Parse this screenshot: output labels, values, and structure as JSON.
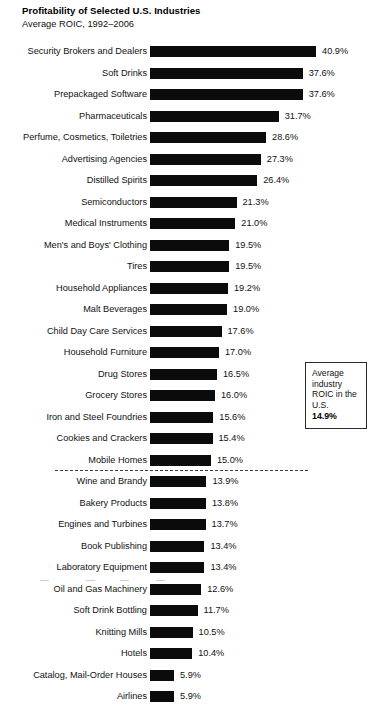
{
  "header": {
    "title": "Profitability of Selected U.S. Industries",
    "subtitle": "Average ROIC, 1992–2006"
  },
  "callout": {
    "line1": "Average industry",
    "line2": "ROIC in the U.S.",
    "value": "14.9%"
  },
  "chart_data": {
    "type": "bar",
    "orientation": "horizontal",
    "title": "Profitability of Selected U.S. Industries",
    "subtitle": "Average ROIC, 1992–2006",
    "xlabel": "",
    "ylabel": "",
    "xlim": [
      0,
      40.9
    ],
    "grid": false,
    "legend": false,
    "value_suffix": "%",
    "bar_color": "#0b0b0b",
    "reference_line": {
      "label": "Average industry ROIC in the U.S.",
      "value": 14.9,
      "value_label": "14.9%",
      "style": "dashed",
      "after_category": "Mobile Homes"
    },
    "categories": [
      "Security Brokers and Dealers",
      "Soft Drinks",
      "Prepackaged Software",
      "Pharmaceuticals",
      "Perfume, Cosmetics, Toiletries",
      "Advertising Agencies",
      "Distilled Spirits",
      "Semiconductors",
      "Medical Instruments",
      "Men's and Boys' Clothing",
      "Tires",
      "Household Appliances",
      "Malt Beverages",
      "Child Day Care Services",
      "Household Furniture",
      "Drug Stores",
      "Grocery Stores",
      "Iron and Steel Foundries",
      "Cookies and Crackers",
      "Mobile Homes",
      "Wine and Brandy",
      "Bakery Products",
      "Engines and Turbines",
      "Book Publishing",
      "Laboratory Equipment",
      "Oil and Gas Machinery",
      "Soft Drink Bottling",
      "Knitting Mills",
      "Hotels",
      "Catalog, Mail-Order Houses",
      "Airlines"
    ],
    "values": [
      40.9,
      37.6,
      37.6,
      31.7,
      28.6,
      27.3,
      26.4,
      21.3,
      21.0,
      19.5,
      19.5,
      19.2,
      19.0,
      17.6,
      17.0,
      16.5,
      16.0,
      15.6,
      15.4,
      15.0,
      13.9,
      13.8,
      13.7,
      13.4,
      13.4,
      12.6,
      11.7,
      10.5,
      10.4,
      5.9,
      5.9
    ],
    "value_labels": [
      "40.9%",
      "37.6%",
      "37.6%",
      "31.7%",
      "28.6%",
      "27.3%",
      "26.4%",
      "21.3%",
      "21.0%",
      "19.5%",
      "19.5%",
      "19.2%",
      "19.0%",
      "17.6%",
      "17.0%",
      "16.5%",
      "16.0%",
      "15.6%",
      "15.4%",
      "15.0%",
      "13.9%",
      "13.8%",
      "13.7%",
      "13.4%",
      "13.4%",
      "12.6%",
      "11.7%",
      "10.5%",
      "10.4%",
      "5.9%",
      "5.9%"
    ]
  }
}
